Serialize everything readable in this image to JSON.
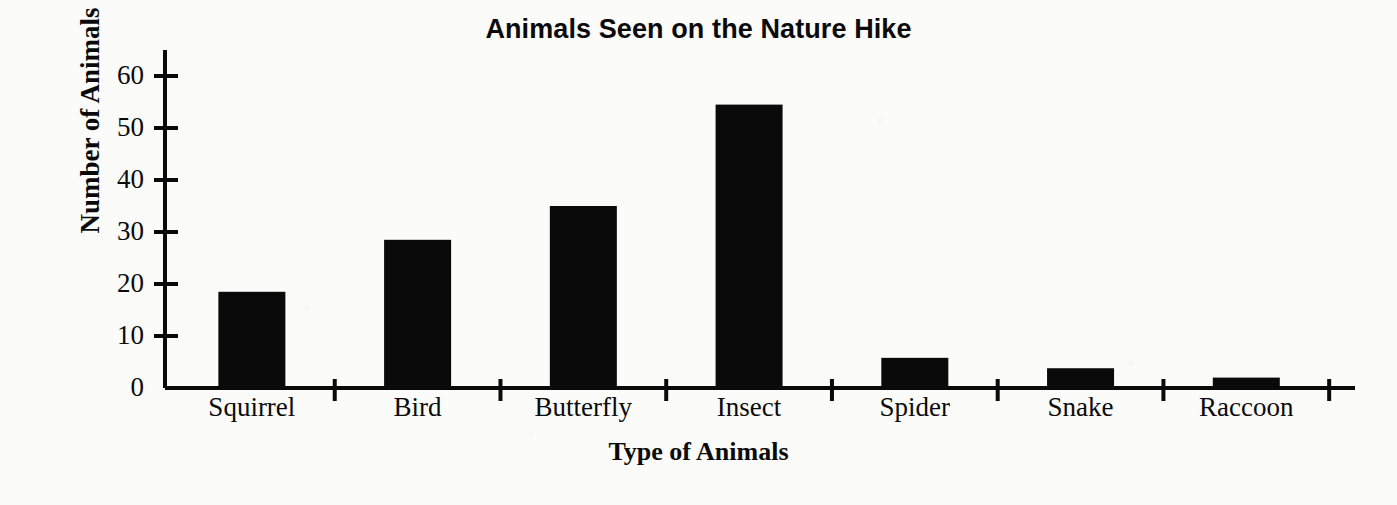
{
  "chart_data": {
    "type": "bar",
    "title": "Animals Seen on the Nature Hike",
    "xlabel": "Type of Animals",
    "ylabel": "Number of Animals",
    "categories": [
      "Squirrel",
      "Bird",
      "Butterfly",
      "Insect",
      "Spider",
      "Snake",
      "Raccoon"
    ],
    "values": [
      18.5,
      28.5,
      35,
      54.5,
      5.8,
      3.8,
      2
    ],
    "ylim": [
      0,
      65
    ],
    "yticks": [
      0,
      10,
      20,
      30,
      40,
      50,
      60
    ],
    "ytick_labels": [
      "0",
      "10",
      "20",
      "30",
      "40",
      "50",
      "60"
    ],
    "grid": false,
    "legend": null,
    "bar_color": "#0a0a0a",
    "axis_color": "#0a0a0a"
  }
}
